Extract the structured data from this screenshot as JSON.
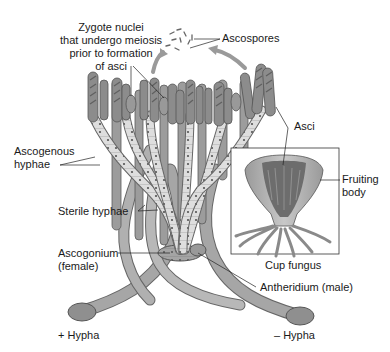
{
  "diagram": {
    "type": "biology-life-cycle",
    "colors": {
      "hypha_fill": "#a9a9a9",
      "hypha_dark": "#7d7d7d",
      "ascogenous_fill": "#dcdcdc",
      "ascus_fill": "#8e8e8e",
      "outline": "#555555",
      "text": "#1a1a1a",
      "arrow": "#9a9a9a"
    },
    "labels": {
      "zygote_nuclei": [
        "Zygote nuclei",
        "that undergo meiosis",
        "prior to formation",
        "of asci"
      ],
      "ascospores": "Ascospores",
      "asci": "Asci",
      "ascogenous_hyphae": [
        "Ascogenous",
        "hyphae"
      ],
      "fruiting_body": [
        "Fruiting",
        "body"
      ],
      "sterile_hyphae": "Sterile hyphae",
      "ascogonium": [
        "Ascogonium",
        "(female)"
      ],
      "cup_fungus": "Cup fungus",
      "antheridium": "Antheridium (male)",
      "plus_hypha": "+ Hypha",
      "minus_hypha": "– Hypha"
    },
    "inset": {
      "title": "Cup fungus",
      "box": {
        "x": 231,
        "y": 148,
        "w": 108,
        "h": 106
      }
    }
  }
}
